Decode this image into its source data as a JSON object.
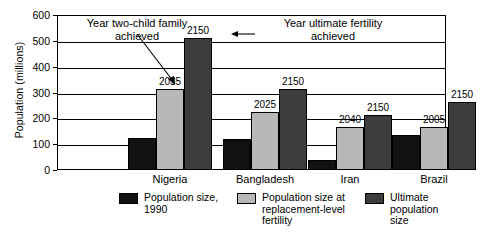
{
  "chart_data": {
    "type": "bar",
    "title": "",
    "xlabel": "",
    "ylabel": "Population (millions)",
    "ylim": [
      0,
      600
    ],
    "yticks": [
      0,
      100,
      200,
      300,
      400,
      500,
      600
    ],
    "ytick_labels": [
      "0",
      "100",
      "200",
      "300",
      "400",
      "500",
      "600"
    ],
    "grid": true,
    "legend_position": "bottom",
    "categories": [
      "Nigeria",
      "Bangladesh",
      "Iran",
      "Brazil"
    ],
    "series": [
      {
        "name": "Population size, 1990",
        "key": "pop1990",
        "color": "#111111",
        "values": [
          125,
          120,
          40,
          137
        ]
      },
      {
        "name": "Population size at replacement-level fertility",
        "key": "replacement",
        "color": "#b8b8b8",
        "values": [
          312,
          225,
          167,
          167
        ]
      },
      {
        "name": "Ultimate population size",
        "key": "ultimate",
        "color": "#3c3c3c",
        "values": [
          512,
          313,
          213,
          265
        ]
      }
    ],
    "data_labels": {
      "replacement": [
        "2035",
        "2025",
        "2040",
        "2005"
      ],
      "ultimate": [
        "2150",
        "2150",
        "2150",
        "2150"
      ]
    },
    "annotations": [
      {
        "name": "year-two-child-family-achieved",
        "text": "Year two-child family\nachieved",
        "points_to": "Nigeria replacement-level bar top"
      },
      {
        "name": "year-ultimate-fertility-achieved",
        "text": "Year ultimate fertility\nachieved",
        "points_to": "Nigeria ultimate population bar label"
      }
    ]
  },
  "legend": {
    "items": [
      {
        "label": "Population size,\n1990",
        "color": "#111111"
      },
      {
        "label": "Population size at\nreplacement-level\nfertility",
        "color": "#b8b8b8"
      },
      {
        "label": "Ultimate\npopulation size",
        "color": "#3c3c3c"
      }
    ]
  }
}
